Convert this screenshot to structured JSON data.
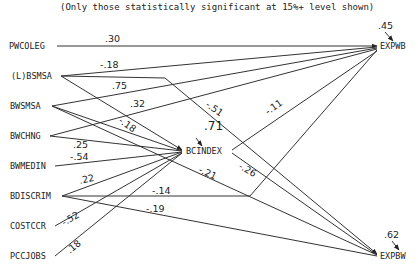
{
  "title": "(Only those statistically significant at 15%+ level shown)",
  "nodes": {
    "pwcoleg": "PWCOLEG",
    "lbsmsa": "(L)BSMSA",
    "bwsmsa": "BWSMSA",
    "bwchng": "BWCHNG",
    "bwmedin": "BWMEDIN",
    "bdiscrim": "BDISCRIM",
    "costccr": "COSTCCR",
    "pccjobs": "PCCJOBS",
    "bcindex": "BCINDEX",
    "expwb": "EXPWB",
    "expbw": "EXPBW"
  },
  "residuals": {
    "bcindex": ".71",
    "expwb": ".45",
    "expbw": ".62"
  },
  "paths": [
    {
      "from": "PWCOLEG",
      "to": "EXPWB",
      "coef": ".30"
    },
    {
      "from": "(L)BSMSA",
      "to": "EXPWB",
      "coef": "-.18"
    },
    {
      "from": "(L)BSMSA",
      "to": "EXPBW",
      "coef": "-.51"
    },
    {
      "from": "(L)BSMSA",
      "to": "BCINDEX",
      "coef": "-.18"
    },
    {
      "from": "BWSMSA",
      "to": "EXPWB",
      "coef": ".75"
    },
    {
      "from": "BWSMSA",
      "to": "BCINDEX",
      "coef": ""
    },
    {
      "from": "BWCHNG",
      "to": "EXPWB",
      "coef": ".32"
    },
    {
      "from": "BWCHNG",
      "to": "BCINDEX",
      "coef": ".25"
    },
    {
      "from": "BWMEDIN",
      "to": "BCINDEX",
      "coef": "-.54"
    },
    {
      "from": "BDISCRIM",
      "to": "BCINDEX",
      "coef": ".22"
    },
    {
      "from": "BDISCRIM",
      "to": "EXPWB",
      "coef": "-.14"
    },
    {
      "from": "BDISCRIM",
      "to": "EXPBW",
      "coef": "-.19"
    },
    {
      "from": "COSTCCR",
      "to": "BCINDEX",
      "coef": "-.52"
    },
    {
      "from": "PCCJOBS",
      "to": "BCINDEX",
      "coef": ".18"
    },
    {
      "from": "BCINDEX",
      "to": "EXPWB",
      "coef": "-.11"
    },
    {
      "from": "BCINDEX",
      "to": "EXPBW",
      "coef": "-.26"
    },
    {
      "from": "BWSMSA",
      "to": "EXPBW",
      "coef": "-.21"
    }
  ],
  "labels": {
    "c1": ".30",
    "c2": "-.18",
    "c3": ".75",
    "c4": ".32",
    "c5": "-.18",
    "c6": "-.51",
    "c7": "-.11",
    "c8": ".25",
    "c9": "-.54",
    "c10": ".22",
    "c11": "-.14",
    "c12": "-.19",
    "c13": "-.52",
    "c14": ".18",
    "c15": "-.26",
    "c16": "-.21"
  }
}
